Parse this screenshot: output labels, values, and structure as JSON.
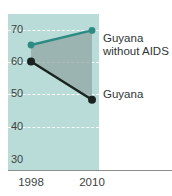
{
  "chart_data": {
    "type": "line",
    "title": "",
    "subtitle": "",
    "xlabel": "",
    "ylabel": "",
    "categories": [
      "1998",
      "2010"
    ],
    "x": [
      1998,
      2010
    ],
    "xtick_labels": [
      "1998",
      "2010"
    ],
    "ytick_labels": [
      "70",
      "60",
      "50",
      "40",
      "30"
    ],
    "yticks": [
      70,
      60,
      50,
      40,
      30
    ],
    "ylim": [
      30,
      73
    ],
    "grid": "horizontal-dashed-white",
    "legend": "inline-annotations-right",
    "plot_background": "#b9dcd9",
    "gap_fill": "#8fa5a1",
    "series": [
      {
        "name": "Guyana without AIDS",
        "color": "#2e8b84",
        "values": [
          64.5,
          68.5
        ],
        "marker": "circle",
        "annotation": "Guyana\nwithout AIDS"
      },
      {
        "name": "Guyana",
        "color": "#1b2321",
        "values": [
          60.0,
          49.5
        ],
        "marker": "circle",
        "annotation": "Guyana"
      }
    ],
    "annotations": [
      {
        "id": "no-aids-label",
        "text": "Guyana\nwithout AIDS"
      },
      {
        "id": "guyana-label",
        "text": "Guyana"
      }
    ],
    "axis_color": "#8a8f8d",
    "tick_text_color": "#3c4443"
  },
  "chart": {
    "yticks": [
      {
        "label": "70",
        "top": 23
      },
      {
        "label": "60",
        "top": 55
      },
      {
        "label": "50",
        "top": 87
      },
      {
        "label": "40",
        "top": 120
      },
      {
        "label": "30",
        "top": 153
      }
    ],
    "gridlines": [
      {
        "label": "70",
        "top": 16
      },
      {
        "label": "60",
        "top": 48
      },
      {
        "label": "50",
        "top": 80
      },
      {
        "label": "40",
        "top": 113
      }
    ],
    "xticks": [
      {
        "label": "1998"
      },
      {
        "label": "2010"
      }
    ],
    "labels": {
      "no_aids": "Guyana\nwithout AIDS",
      "guyana": "Guyana"
    },
    "top_strip_text": ""
  }
}
